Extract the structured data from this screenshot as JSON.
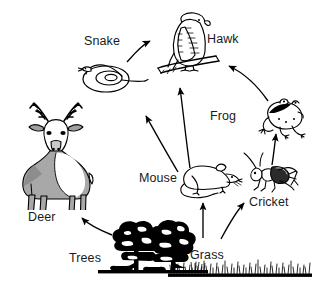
{
  "diagram": {
    "type": "food-web",
    "background_color": "#ffffff",
    "ink_color": "#000000",
    "label_color": "#1a1a1a",
    "deer_body_color": "#a8a8a8",
    "deer_shadow_color": "#8d8d8d",
    "nodes": [
      {
        "id": "deer",
        "label": "Deer",
        "role": "consumer",
        "label_x": 28,
        "label_y": 211
      },
      {
        "id": "snake",
        "label": "Snake",
        "role": "consumer",
        "label_x": 84,
        "label_y": 35
      },
      {
        "id": "hawk",
        "label": "Hawk",
        "role": "consumer",
        "label_x": 207,
        "label_y": 33
      },
      {
        "id": "frog",
        "label": "Frog",
        "role": "consumer",
        "label_x": 210,
        "label_y": 110
      },
      {
        "id": "cricket",
        "label": "Cricket",
        "role": "consumer",
        "label_x": 249,
        "label_y": 196
      },
      {
        "id": "mouse",
        "label": "Mouse",
        "role": "consumer",
        "label_x": 139,
        "label_y": 172
      },
      {
        "id": "trees",
        "label": "Trees",
        "role": "producer",
        "label_x": 69,
        "label_y": 252
      },
      {
        "id": "grass",
        "label": "Grass",
        "role": "producer",
        "label_x": 190,
        "label_y": 249
      }
    ],
    "arrows": [
      {
        "from": "snake",
        "to": "hawk"
      },
      {
        "from": "frog",
        "to": "hawk"
      },
      {
        "from": "mouse",
        "to": "hawk"
      },
      {
        "from": "mouse",
        "to": "snake"
      },
      {
        "from": "cricket",
        "to": "frog"
      },
      {
        "from": "grass",
        "to": "mouse"
      },
      {
        "from": "grass",
        "to": "cricket"
      },
      {
        "from": "trees",
        "to": "deer"
      }
    ]
  }
}
